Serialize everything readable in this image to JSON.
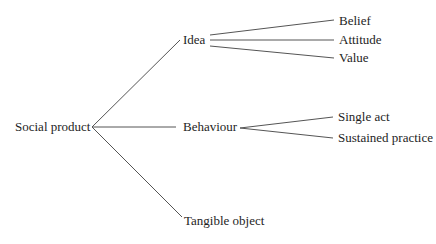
{
  "diagram": {
    "type": "tree",
    "root": {
      "label": "Social product"
    },
    "branches": [
      {
        "label": "Idea",
        "children": [
          {
            "label": "Belief"
          },
          {
            "label": "Attitude"
          },
          {
            "label": "Value"
          }
        ]
      },
      {
        "label": "Behaviour",
        "children": [
          {
            "label": "Single act"
          },
          {
            "label": "Sustained practice"
          }
        ]
      },
      {
        "label": "Tangible object",
        "children": []
      }
    ],
    "line_color": "#555555",
    "text_color": "#1e1e1e"
  }
}
